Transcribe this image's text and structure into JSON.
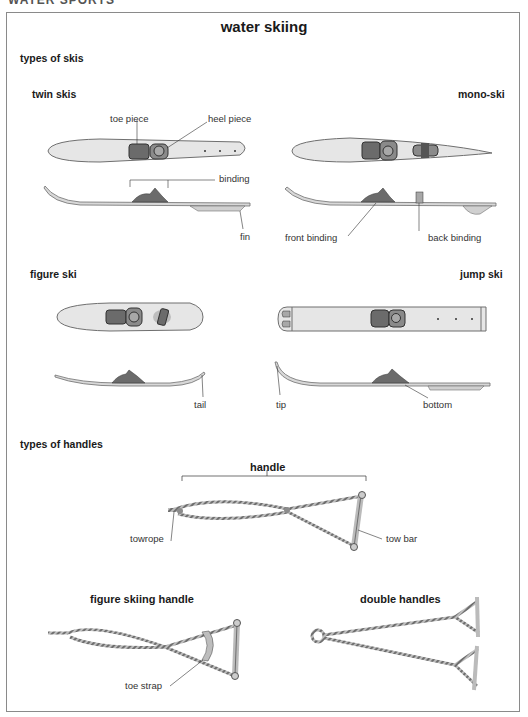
{
  "page": {
    "cut_heading": "WATER SPORTS",
    "title": "water skiing"
  },
  "sections": {
    "skis": {
      "heading": "types of skis",
      "twin_skis": {
        "title": "twin skis",
        "labels": {
          "toe_piece": "toe piece",
          "heel_piece": "heel piece",
          "binding": "binding",
          "fin": "fin"
        }
      },
      "mono_ski": {
        "title": "mono-ski",
        "labels": {
          "front_binding": "front binding",
          "back_binding": "back binding"
        }
      },
      "figure_ski": {
        "title": "figure ski",
        "labels": {
          "tail": "tail"
        }
      },
      "jump_ski": {
        "title": "jump ski",
        "labels": {
          "tip": "tip",
          "bottom": "bottom"
        }
      }
    },
    "handles": {
      "heading": "types of handles",
      "handle": {
        "title": "handle",
        "labels": {
          "towrope": "towrope",
          "tow_bar": "tow bar"
        }
      },
      "figure_skiing_handle": {
        "title": "figure skiing handle",
        "labels": {
          "toe_strap": "toe strap"
        }
      },
      "double_handles": {
        "title": "double handles"
      }
    }
  },
  "colors": {
    "ski_fill": "#e6e6e6",
    "ski_outline": "#6f6f6f",
    "binding_fill": "#6b6b6b",
    "binding_light": "#a8a8a8",
    "rope": "#8c8c8c",
    "frame": "#8a8a8a"
  }
}
